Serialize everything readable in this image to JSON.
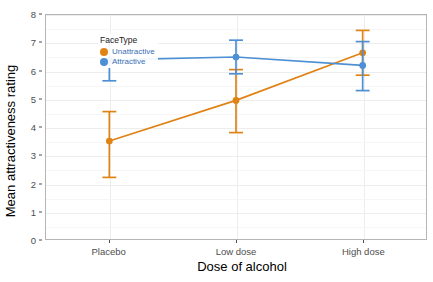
{
  "chart_data": {
    "type": "line",
    "title": "",
    "subtitle": "",
    "xlabel": "Dose of alcohol",
    "ylabel": "Mean attractiveness rating",
    "categories": [
      "Placebo",
      "Low dose",
      "High dose"
    ],
    "ylim": [
      0,
      8
    ],
    "yticks": [
      0,
      1,
      2,
      3,
      4,
      5,
      6,
      7,
      8
    ],
    "ytick_labels": [
      "0",
      "1",
      "2",
      "3",
      "4",
      "5",
      "6",
      "7",
      "8"
    ],
    "grid": true,
    "legend_position": "top-left inside panel",
    "legend_title": "FaceType",
    "error_bars": "vertical with caps",
    "series": [
      {
        "name": "Unattractive",
        "color": "#e08214",
        "values": [
          3.5,
          4.95,
          6.65
        ],
        "err_low": [
          2.2,
          3.8,
          5.85
        ],
        "err_high": [
          4.55,
          6.05,
          7.45
        ]
      },
      {
        "name": "Attractive",
        "color": "#4c8fd4",
        "values": [
          6.4,
          6.5,
          6.2
        ],
        "err_low": [
          5.65,
          5.9,
          5.3
        ],
        "err_high": [
          7.1,
          7.1,
          7.05
        ]
      }
    ]
  },
  "legend": {
    "title": "FaceType",
    "items": [
      {
        "label": "Unattractive",
        "color": "#e08214"
      },
      {
        "label": "Attractive",
        "color": "#4c8fd4"
      }
    ]
  },
  "axes": {
    "y_title": "Mean attractiveness rating",
    "x_title": "Dose of alcohol"
  }
}
